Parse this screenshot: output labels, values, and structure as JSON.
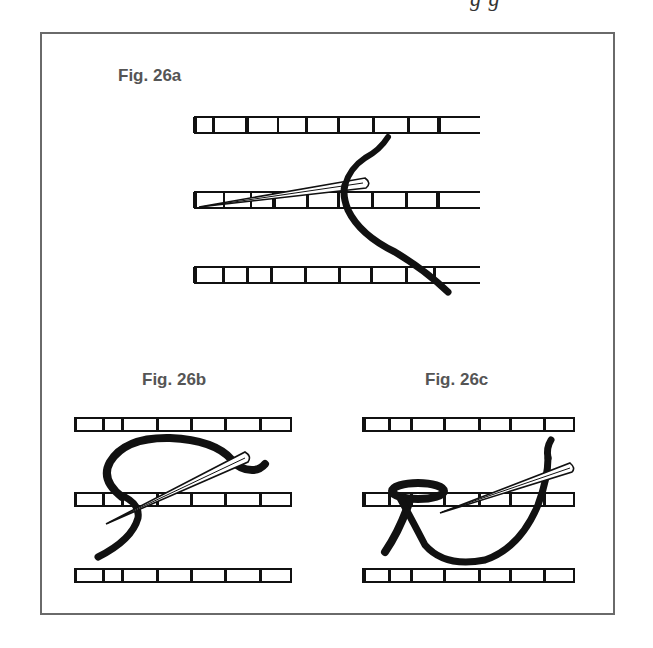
{
  "page": {
    "header_fragment": "g      g",
    "frame": {
      "border_color": "#6a6a6a"
    }
  },
  "figures": [
    {
      "id": "26a",
      "label": "Fig.  26a",
      "description": "Needle passing under canvas threads on middle strip; thread crossing from top strip down to bottom strip"
    },
    {
      "id": "26b",
      "label": "Fig.  26b",
      "description": "Thread looped over top, needle inserted diagonally through middle strip"
    },
    {
      "id": "26c",
      "label": "Fig.  26c",
      "description": "Thread loop wrapped around middle strip with needle passing through, thread curving up to the right"
    }
  ],
  "colors": {
    "ink": "#111111",
    "label": "#555555",
    "paper": "#ffffff"
  }
}
